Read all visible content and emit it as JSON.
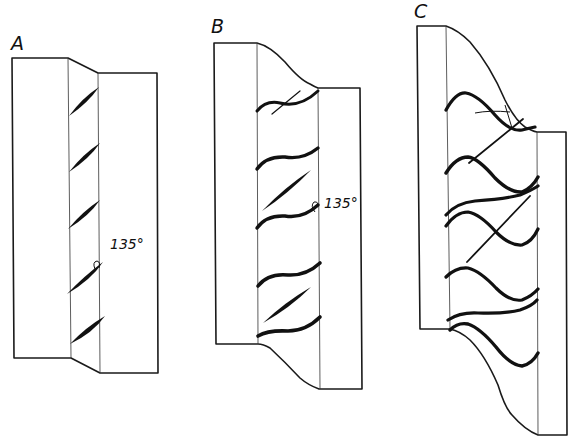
{
  "figure": {
    "panels": [
      {
        "id": "A",
        "label": "A",
        "angle_label": "135°",
        "description": "Straight, simple offset block with diagonal lens-shaped en-echelon strokes in the shear zone",
        "stroke_count": 5
      },
      {
        "id": "B",
        "label": "B",
        "angle_label": "135°",
        "description": "Moderately curved offset with S-shaped sigmoidal strokes and thin straight cross-strokes",
        "stroke_count": 5,
        "cross_line_count": 3
      },
      {
        "id": "C",
        "label": "C",
        "description": "Strongly curved offset with pronounced sigmoidal strokes and crossing straight lines",
        "stroke_count": 7,
        "cross_line_count": 3
      }
    ],
    "colors": {
      "background": "#ffffff",
      "ink": "#111111"
    }
  }
}
